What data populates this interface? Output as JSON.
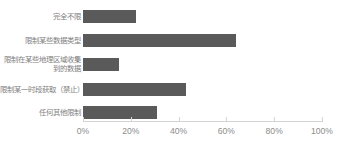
{
  "chart_data": {
    "type": "bar",
    "orientation": "horizontal",
    "title": "",
    "subtitle": "",
    "xlabel": "",
    "ylabel": "",
    "categories": [
      "完全不限",
      "限制某些数据类型",
      "限制在某些地理区域收集到的数据",
      "限制某一时段获取（禁止）",
      "任何其他限制"
    ],
    "values": [
      22,
      64,
      15,
      43,
      31
    ],
    "value_suffix": "%",
    "xlim": [
      0,
      100
    ],
    "xticks": [
      0,
      20,
      40,
      60,
      80,
      100
    ],
    "xtick_labels": [
      "0%",
      "20%",
      "40%",
      "60%",
      "80%",
      "100%"
    ],
    "grid": false,
    "legend": null,
    "series": [
      {
        "name": "",
        "values": [
          22,
          64,
          15,
          43,
          31
        ]
      }
    ]
  },
  "style": {
    "bar_color": "#5a5a5a",
    "axis_color": "#d4d4d4",
    "label_color": "#808080",
    "tick_label_color": "#8c8c8c",
    "background": "#ffffff"
  }
}
